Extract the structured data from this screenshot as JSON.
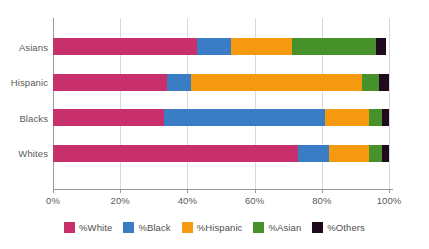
{
  "chart_data": {
    "type": "bar",
    "orientation": "horizontal",
    "stacked": true,
    "normalized_percent": true,
    "title": "",
    "subtitle": "",
    "xlabel": "",
    "ylabel": "",
    "xlim": [
      0,
      100
    ],
    "xticks": [
      0,
      20,
      40,
      60,
      80,
      100
    ],
    "xtick_labels": [
      "0%",
      "20%",
      "40%",
      "60%",
      "80%",
      "100%"
    ],
    "grid": true,
    "grid_axis": "x",
    "legend_position": "bottom",
    "categories": [
      "Asians",
      "Hispanic",
      "Blacks",
      "Whites"
    ],
    "category_order_top_to_bottom": [
      "Asians",
      "Hispanic",
      "Blacks",
      "Whites"
    ],
    "series": [
      {
        "name": "%White",
        "color": "#c8306c",
        "values": [
          43,
          34,
          33,
          73
        ]
      },
      {
        "name": "%Black",
        "color": "#3a7dc4",
        "values": [
          10,
          7,
          48,
          9
        ]
      },
      {
        "name": "%Hispanic",
        "color": "#f59a10",
        "values": [
          18,
          51,
          13,
          12
        ]
      },
      {
        "name": "%Asian",
        "color": "#47912a",
        "values": [
          25,
          5,
          4,
          4
        ]
      },
      {
        "name": "%Others",
        "color": "#1f0a1e",
        "values": [
          3,
          3,
          2,
          2
        ]
      }
    ]
  },
  "colors": {
    "white_series": "#c8306c",
    "black_series": "#3a7dc4",
    "hispanic_series": "#f59a10",
    "asian_series": "#47912a",
    "others_series": "#1f0a1e",
    "axis": "#9a9a9a",
    "gridline": "#d9d9d9",
    "text": "#5a5a5a",
    "background": "#ffffff"
  }
}
